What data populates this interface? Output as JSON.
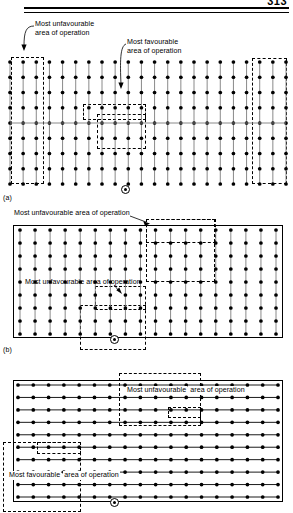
{
  "page": {
    "page_number": "313",
    "background_color": "#ffffff",
    "ink_color": "#000000"
  },
  "header": {
    "rule_thick": true,
    "rule_thin": true
  },
  "panels": [
    {
      "id": "a",
      "caption": "(a)",
      "orientation": "vertical",
      "grid": {
        "columns": 22,
        "rows": 9,
        "line_direction": "vertical",
        "dot_color": "#000000",
        "line_color": "#7d7d7d",
        "has_solid_frame": false,
        "mid_horizontal_rule": true
      },
      "annotations": [
        {
          "name": "most-unfavourable-left",
          "lines": [
            "Most unfavourable",
            "area of operation"
          ],
          "points_to": "left-edge-region"
        },
        {
          "name": "most-favourable-centre",
          "lines": [
            "Most favourable",
            "area of operation"
          ],
          "points_to": "centre-region"
        }
      ],
      "dashed_regions": [
        {
          "name": "left-unfavourable-band"
        },
        {
          "name": "right-unfavourable-band"
        },
        {
          "name": "centre-favourable-step"
        }
      ],
      "origin_marker": true
    },
    {
      "id": "b",
      "caption": "(b)",
      "orientation": "vertical",
      "grid": {
        "columns": 18,
        "rows": 9,
        "line_direction": "vertical",
        "dot_color": "#000000",
        "line_color": "#7d7d7d",
        "has_solid_frame": true,
        "mid_horizontal_rule": false
      },
      "annotations": [
        {
          "name": "most-unfavourable-upper",
          "lines": [
            "Most unfavourable area of operation"
          ],
          "points_to": "upper-right-region"
        },
        {
          "name": "most-unfavourable-lower",
          "lines": [
            "Most unfavourable area of operation"
          ],
          "points_to": "lower-centre-region"
        }
      ],
      "dashed_regions": [
        {
          "name": "upper-right-block"
        },
        {
          "name": "lower-centre-block"
        },
        {
          "name": "lower-left-step"
        },
        {
          "name": "bottom-centre-block"
        }
      ],
      "origin_marker": true
    },
    {
      "id": "c",
      "caption": "(c)",
      "orientation": "horizontal",
      "grid": {
        "columns": 18,
        "rows": 10,
        "line_direction": "horizontal",
        "dot_color": "#000000",
        "line_color": "#000000",
        "has_solid_frame": true,
        "mid_horizontal_rule": false
      },
      "annotations": [
        {
          "name": "most-unfavourable-upper-centre",
          "lines": [
            "Most unfavourable",
            "area of operation"
          ],
          "points_to": "upper-centre-region"
        },
        {
          "name": "most-favourable-lower-left",
          "lines": [
            "Most favourable",
            "area of operation"
          ],
          "points_to": "lower-left-region"
        }
      ],
      "dashed_regions": [
        {
          "name": "upper-centre-block"
        },
        {
          "name": "upper-centre-small-step"
        },
        {
          "name": "lower-left-block"
        },
        {
          "name": "lower-left-small-step"
        }
      ],
      "origin_marker": true
    }
  ]
}
